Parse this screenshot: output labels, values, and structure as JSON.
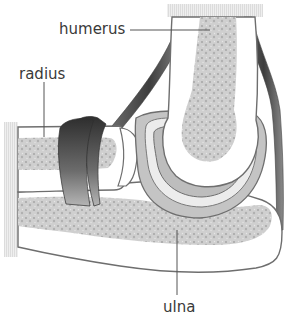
{
  "diagram": {
    "labels": {
      "humerus": "humerus",
      "radius": "radius",
      "ulna": "ulna"
    },
    "colors": {
      "background": "#ffffff",
      "bone_outline": "#6e6e6e",
      "marrow": "#c8c8c8",
      "cartilage": "#b4b4b4",
      "ligament": "#4a4a4a",
      "text": "#3a3a3a"
    }
  }
}
